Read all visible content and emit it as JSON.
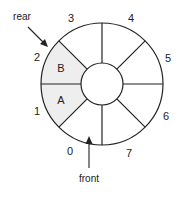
{
  "diagram": {
    "type": "circular-queue",
    "slots": [
      {
        "index": "0",
        "content": ""
      },
      {
        "index": "1",
        "content": "A"
      },
      {
        "index": "2",
        "content": "B"
      },
      {
        "index": "3",
        "content": ""
      },
      {
        "index": "4",
        "content": ""
      },
      {
        "index": "5",
        "content": ""
      },
      {
        "index": "6",
        "content": ""
      },
      {
        "index": "7",
        "content": ""
      }
    ],
    "pointers": {
      "rear": "rear",
      "front": "front"
    },
    "colors": {
      "filled": "#eeeeee",
      "stroke": "#222222"
    }
  }
}
